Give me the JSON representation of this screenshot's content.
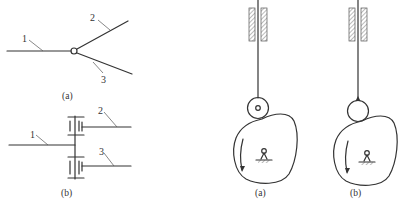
{
  "figure_left": {
    "panel_a": {
      "caption": "(a)",
      "labels": {
        "link1": "1",
        "link2": "2",
        "link3": "3"
      },
      "joint": "hinge"
    },
    "panel_b": {
      "caption": "(b)",
      "labels": {
        "link1": "1",
        "link2": "2",
        "link3": "3"
      },
      "joint": "gear-pair"
    }
  },
  "figure_right": {
    "panel_a": {
      "caption": "(a)",
      "follower": "roller"
    },
    "panel_b": {
      "caption": "(b)",
      "follower": "pointed"
    }
  },
  "colors": {
    "line": "#333333",
    "hatch": "#555555",
    "background": "#ffffff"
  }
}
